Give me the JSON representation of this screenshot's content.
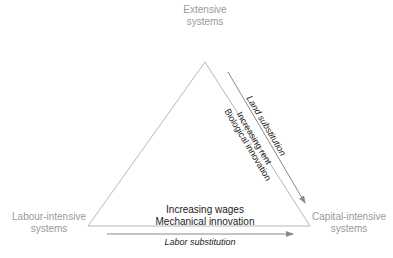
{
  "vertices": {
    "top": {
      "line1": "Extensive",
      "line2": "systems"
    },
    "left": {
      "line1": "Labour-intensive",
      "line2": "systems"
    },
    "right": {
      "line1": "Capital-intensive",
      "line2": "systems"
    }
  },
  "arrows": {
    "land": "Land substitution",
    "labor": "Labor substitution"
  },
  "drivers": {
    "rent": "Increasing rent",
    "bio": "Biological innovation",
    "wages": "Increasing wages",
    "mech": "Mechanical innovation"
  },
  "colors": {
    "line": "#b0b0b0",
    "arrow": "#8a8a8a",
    "vertex_text": "#9a9a9a",
    "text": "#222222"
  }
}
